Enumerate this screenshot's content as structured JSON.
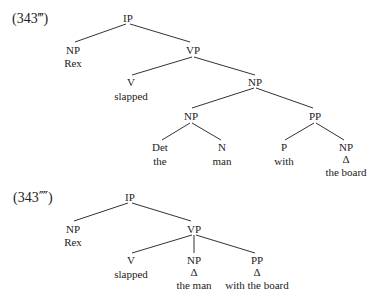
{
  "trees": [
    {
      "example_label": "(343‴)",
      "nodes": [
        {
          "id": "ip",
          "label": "IP"
        },
        {
          "id": "np_subj",
          "label": "NP",
          "words": "Rex"
        },
        {
          "id": "vp",
          "label": "VP"
        },
        {
          "id": "v",
          "label": "V",
          "words": "slapped"
        },
        {
          "id": "np_obj",
          "label": "NP"
        },
        {
          "id": "np_inner",
          "label": "NP"
        },
        {
          "id": "pp",
          "label": "PP"
        },
        {
          "id": "det",
          "label": "Det",
          "words": "the"
        },
        {
          "id": "n",
          "label": "N",
          "words": "man"
        },
        {
          "id": "p",
          "label": "P",
          "words": "with"
        },
        {
          "id": "np_pp",
          "label": "NP",
          "triangle": "Δ",
          "words": "the board"
        }
      ],
      "edges": [
        [
          "ip",
          "np_subj"
        ],
        [
          "ip",
          "vp"
        ],
        [
          "vp",
          "v"
        ],
        [
          "vp",
          "np_obj"
        ],
        [
          "np_obj",
          "np_inner"
        ],
        [
          "np_obj",
          "pp"
        ],
        [
          "np_inner",
          "det"
        ],
        [
          "np_inner",
          "n"
        ],
        [
          "pp",
          "p"
        ],
        [
          "pp",
          "np_pp"
        ]
      ]
    },
    {
      "example_label": "(343⁗)",
      "nodes": [
        {
          "id": "ip",
          "label": "IP"
        },
        {
          "id": "np_subj",
          "label": "NP",
          "words": "Rex"
        },
        {
          "id": "vp",
          "label": "VP"
        },
        {
          "id": "v",
          "label": "V",
          "words": "slapped"
        },
        {
          "id": "np_obj",
          "label": "NP",
          "triangle": "Δ",
          "words": "the man"
        },
        {
          "id": "pp",
          "label": "PP",
          "triangle": "Δ",
          "words": "with the board"
        }
      ],
      "edges": [
        [
          "ip",
          "np_subj"
        ],
        [
          "ip",
          "vp"
        ],
        [
          "vp",
          "v"
        ],
        [
          "vp",
          "np_obj"
        ],
        [
          "vp",
          "pp"
        ]
      ]
    }
  ]
}
